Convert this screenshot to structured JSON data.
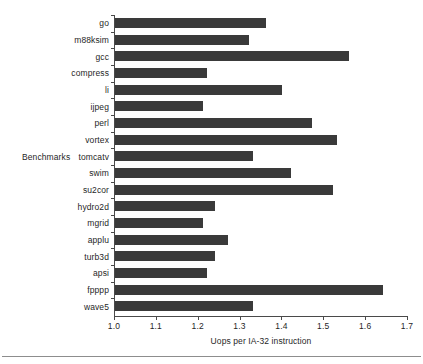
{
  "chart_data": {
    "type": "bar",
    "orientation": "horizontal",
    "title": "",
    "xlabel": "Uops per IA-32 instruction",
    "ylabel": "Benchmarks",
    "xlim": [
      1.0,
      1.7
    ],
    "xticks": [
      "1.0",
      "1.1",
      "1.2",
      "1.3",
      "1.4",
      "1.5",
      "1.6",
      "1.7"
    ],
    "grid": false,
    "legend": null,
    "bar_color": "#3a3a3a",
    "axis_color": "#4a4a4a",
    "categories": [
      "go",
      "m88ksim",
      "gcc",
      "compress",
      "li",
      "ijpeg",
      "perl",
      "vortex",
      "tomcatv",
      "swim",
      "su2cor",
      "hydro2d",
      "mgrid",
      "applu",
      "turb3d",
      "apsi",
      "fpppp",
      "wave5"
    ],
    "values": [
      1.36,
      1.32,
      1.56,
      1.22,
      1.4,
      1.21,
      1.47,
      1.53,
      1.33,
      1.42,
      1.52,
      1.24,
      1.21,
      1.27,
      1.24,
      1.22,
      1.64,
      1.33
    ]
  }
}
